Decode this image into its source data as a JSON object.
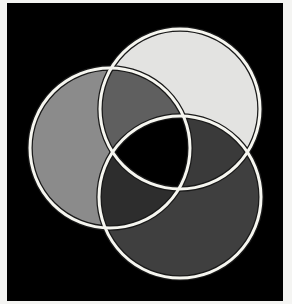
{
  "diagram": {
    "type": "venn",
    "set_count": 3,
    "title": "",
    "labels": [],
    "colors": {
      "page_background": "#f4f4f2",
      "panel_background": "#000000",
      "outline_white": "#f6f6f0",
      "outline_dark": "#1a1a1a",
      "top_only": "#e3e3e1",
      "left_only": "#8b8b8b",
      "bottom_only": "#3f3f3f",
      "left_top": "#5f5f5f",
      "top_bottom": "#3a3a3a",
      "left_bottom": "#2d2d2d",
      "all_three": "#000000"
    },
    "panel": {
      "x": 7,
      "y": 3,
      "width": 276,
      "height": 298
    },
    "circles": [
      {
        "id": "top",
        "cx": 180,
        "cy": 109,
        "r": 80
      },
      {
        "id": "left",
        "cx": 110,
        "cy": 148,
        "r": 80
      },
      {
        "id": "bottom",
        "cx": 180,
        "cy": 197,
        "r": 81
      }
    ]
  }
}
